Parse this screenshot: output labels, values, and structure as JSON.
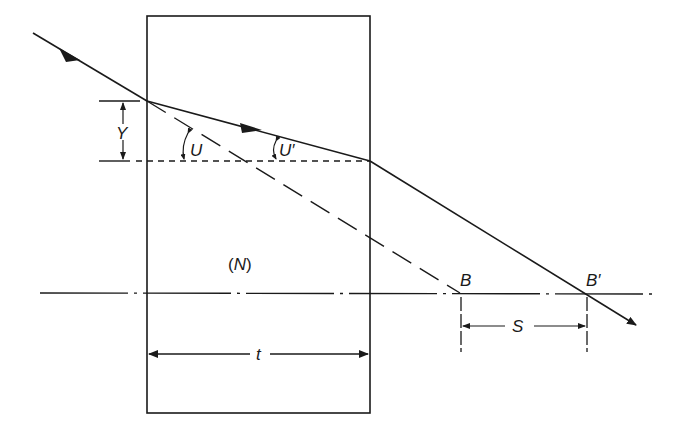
{
  "diagram": {
    "colors": {
      "line": "#1a1a1a",
      "background": "#ffffff"
    },
    "labels": {
      "height": "Y",
      "angle_incident": "U",
      "angle_refracted": "U′",
      "medium": "(N)",
      "thickness": "t",
      "point_original": "B",
      "point_shifted": "B′",
      "shift": "S"
    },
    "elements": {
      "plate": "rectangle slab of index N",
      "optical_axis": "dash-dot horizontal axis",
      "incident_ray": "solid ray with arrow entering plate",
      "refracted_ray": "solid ray inside plate with arrow",
      "exit_ray": "solid ray leaving plate, crossing axis at B′",
      "virtual_ray": "long-dash extension of incident ray meeting axis at B",
      "reference_line": "short-dash horizontal line at exit height"
    }
  }
}
